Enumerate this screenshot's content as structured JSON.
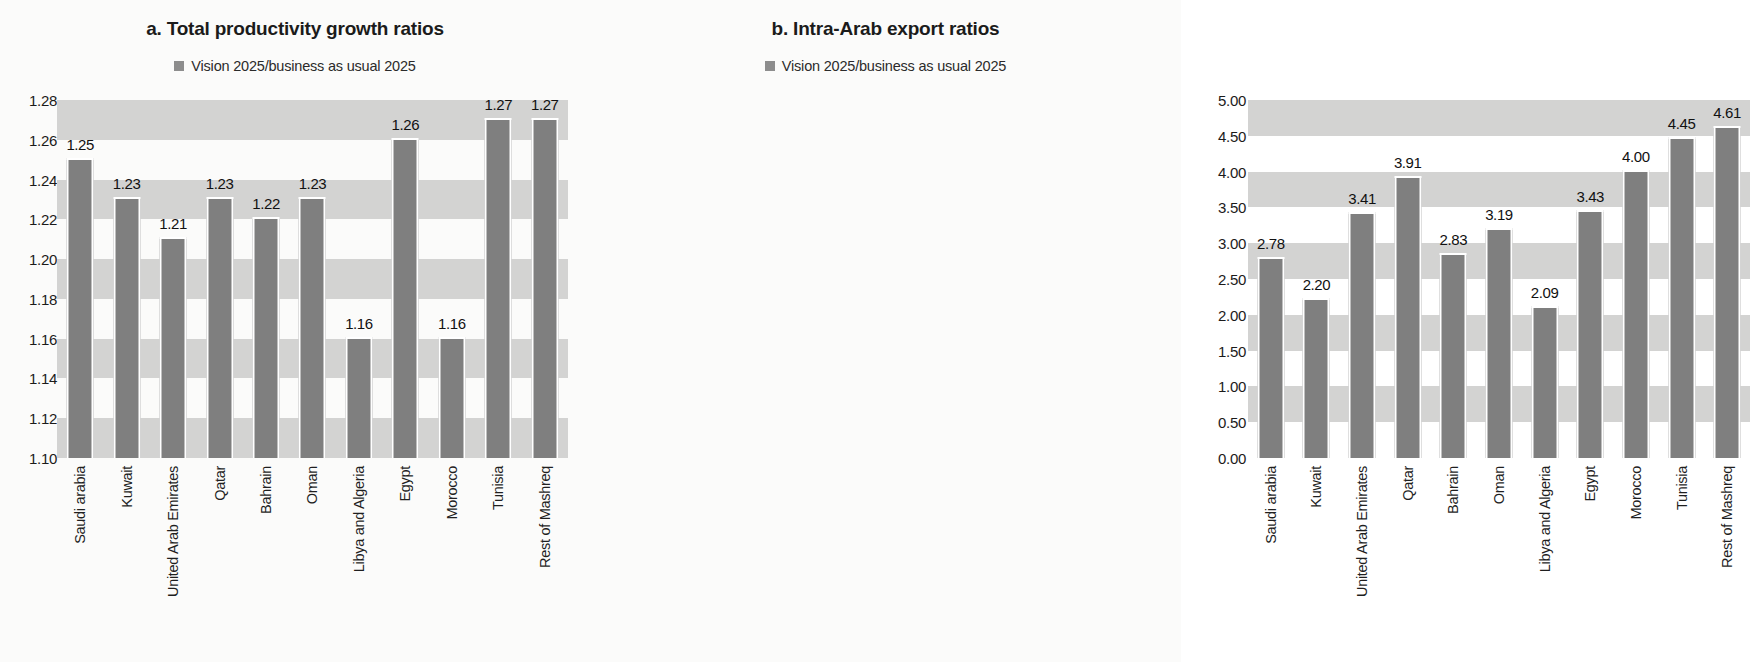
{
  "panels": [
    {
      "id": "a",
      "title": "a. Total productivity growth ratios",
      "legend_label": "Vision 2025/business as usual 2025",
      "legend_icon": "legend-square-icon"
    },
    {
      "id": "b",
      "title": "b. Intra-Arab export ratios",
      "legend_label": "Vision 2025/business as usual 2025",
      "legend_icon": "legend-square-icon"
    }
  ],
  "colors": {
    "bar": "#7f7f7f",
    "band": "#d3d3d2",
    "background": "#fbfbfa",
    "text": "#1b1b1b"
  },
  "chart_data": [
    {
      "type": "bar",
      "title": "a. Total productivity growth ratios",
      "xlabel": "",
      "ylabel": "",
      "ylim": [
        1.1,
        1.28
      ],
      "ytick_step": 0.02,
      "grid": true,
      "legend": [
        "Vision 2025/business as usual 2025"
      ],
      "legend_position": "top-center",
      "yticks": [
        "1.28",
        "1.26",
        "1.24",
        "1.22",
        "1.20",
        "1.18",
        "1.16",
        "1.14",
        "1.12",
        "1.10"
      ],
      "categories": [
        "Saudi arabia",
        "Kuwait",
        "United Arab Emirates",
        "Qatar",
        "Bahrain",
        "Oman",
        "Libya and Algeria",
        "Egypt",
        "Morocco",
        "Tunisia",
        "Rest of Mashreq"
      ],
      "values": [
        1.25,
        1.23,
        1.21,
        1.23,
        1.22,
        1.23,
        1.16,
        1.26,
        1.16,
        1.27,
        1.27
      ],
      "value_labels": [
        "1.25",
        "1.23",
        "1.21",
        "1.23",
        "1.22",
        "1.23",
        "1.16",
        "1.26",
        "1.16",
        "1.27",
        "1.27"
      ]
    },
    {
      "type": "bar",
      "title": "b. Intra-Arab export ratios",
      "xlabel": "",
      "ylabel": "",
      "ylim": [
        0.0,
        5.0
      ],
      "ytick_step": 0.5,
      "grid": true,
      "legend": [
        "Vision 2025/business as usual 2025"
      ],
      "legend_position": "top-center",
      "yticks": [
        "5.00",
        "4.50",
        "4.00",
        "3.50",
        "3.00",
        "2.50",
        "2.00",
        "1.50",
        "1.00",
        "0.50",
        "0.00"
      ],
      "categories": [
        "Saudi arabia",
        "Kuwait",
        "United Arab Emirates",
        "Qatar",
        "Bahrain",
        "Oman",
        "Libya and Algeria",
        "Egypt",
        "Morocco",
        "Tunisia",
        "Rest of Mashreq"
      ],
      "values": [
        2.78,
        2.2,
        3.41,
        3.91,
        2.83,
        3.19,
        2.09,
        3.43,
        4.0,
        4.45,
        4.61
      ],
      "value_labels": [
        "2.78",
        "2.20",
        "3.41",
        "3.91",
        "2.83",
        "3.19",
        "2.09",
        "3.43",
        "4.00",
        "4.45",
        "4.61"
      ]
    }
  ]
}
